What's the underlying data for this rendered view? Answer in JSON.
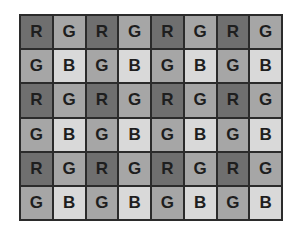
{
  "diagram": {
    "type": "bayer-filter-mosaic",
    "columns": 8,
    "rows": 6,
    "colors": {
      "R": "#6f6f6f",
      "G": "#a6a6a6",
      "B": "#d9d9d9",
      "border": "#2b2b2b",
      "text": "#1e1e1e"
    },
    "grid": [
      [
        "R",
        "G",
        "R",
        "G",
        "R",
        "G",
        "R",
        "G"
      ],
      [
        "G",
        "B",
        "G",
        "B",
        "G",
        "B",
        "G",
        "B"
      ],
      [
        "R",
        "G",
        "R",
        "G",
        "R",
        "G",
        "R",
        "G"
      ],
      [
        "G",
        "B",
        "G",
        "B",
        "G",
        "B",
        "G",
        "B"
      ],
      [
        "R",
        "G",
        "R",
        "G",
        "R",
        "G",
        "R",
        "G"
      ],
      [
        "G",
        "B",
        "G",
        "B",
        "G",
        "B",
        "G",
        "B"
      ]
    ]
  }
}
